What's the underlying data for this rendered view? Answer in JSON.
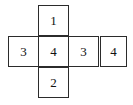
{
  "diagram": {
    "kind": "cube-net",
    "colors": {
      "border": "#2b2b2b",
      "background": "#ffffff",
      "text": "#111111"
    },
    "grid": {
      "rows": 3,
      "columns": 4,
      "cell_size": 31
    },
    "cells": [
      {
        "id": "cell-top",
        "row": 0,
        "column": 1,
        "label": "1"
      },
      {
        "id": "cell-middle-left",
        "row": 1,
        "column": 0,
        "label": "3"
      },
      {
        "id": "cell-middle-inner",
        "row": 1,
        "column": 1,
        "label": "4"
      },
      {
        "id": "cell-middle-outer",
        "row": 1,
        "column": 2,
        "label": "3"
      },
      {
        "id": "cell-middle-right",
        "row": 1,
        "column": 3,
        "label": "4"
      },
      {
        "id": "cell-bottom",
        "row": 2,
        "column": 1,
        "label": "2"
      }
    ]
  }
}
